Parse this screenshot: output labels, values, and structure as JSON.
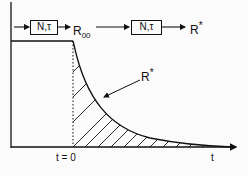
{
  "diagram": {
    "block1": {
      "label": "N,τ"
    },
    "block2": {
      "label": "N,τ"
    },
    "r_inf": {
      "main": "R",
      "sub": "00"
    },
    "r_star_top": {
      "main": "R",
      "sup": "*"
    },
    "r_star_curve": {
      "main": "R",
      "sup": "*"
    },
    "t0_label": "t = 0",
    "t_axis_label": "t"
  },
  "colors": {
    "ink": "#111111",
    "background": "#fbfbfb"
  }
}
